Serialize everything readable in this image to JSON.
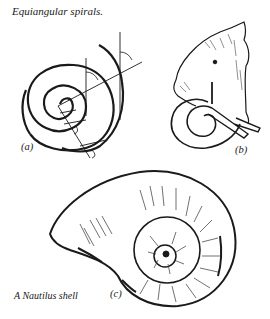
{
  "figure": {
    "title": "Equiangular spirals.",
    "panels": [
      {
        "id": "a",
        "label": "(a)",
        "subject": "equiangular spiral with radial line and tangent angles"
      },
      {
        "id": "b",
        "label": "(b)",
        "subject": "elephant head with curled tusk"
      },
      {
        "id": "c",
        "label": "(c)",
        "subject": "nautilus shell",
        "caption": "A Nautilus shell"
      }
    ],
    "colors": {
      "ink": "#1a1a1a",
      "background": "#ffffff"
    }
  }
}
